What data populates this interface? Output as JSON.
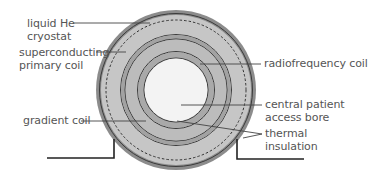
{
  "diagram": {
    "center": {
      "x": 176,
      "y": 90
    },
    "colors": {
      "outer_shell": "#8c8c8c",
      "cryostat_fill": "#c6c6c6",
      "primary_band": "#a2a2a2",
      "gradient_fill": "#bcbcbc",
      "rf_band": "#a9a9a9",
      "bore": "#f3f3f3",
      "line": "#3a3a3a",
      "leader": "#444444",
      "label_text": "#555555"
    },
    "labels": {
      "liquid_he": {
        "line1": "liquid He",
        "line2": "cryostat"
      },
      "superconducting": {
        "line1": "superconducting",
        "line2": "primary coil"
      },
      "radiofrequency": {
        "line1": "radiofrequency coil"
      },
      "gradient": {
        "line1": "gradient coil"
      },
      "bore": {
        "line1": "central patient",
        "line2": "access bore"
      },
      "thermal": {
        "line1": "thermal",
        "line2": "insulation"
      }
    }
  }
}
